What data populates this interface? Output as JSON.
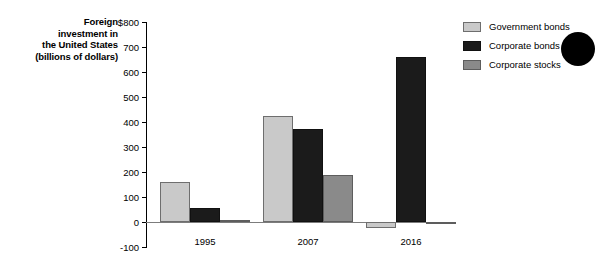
{
  "chart_data": {
    "type": "bar",
    "title": "",
    "ylabel": "Foreign investment in the United States (billions of dollars)",
    "xlabel": "",
    "categories": [
      "1995",
      "2007",
      "2016"
    ],
    "series": [
      {
        "name": "Government bonds",
        "color": "#c9c9c9",
        "values": [
          160,
          425,
          -25
        ]
      },
      {
        "name": "Corporate bonds",
        "color": "#1b1b1b",
        "values": [
          57,
          372,
          662
        ]
      },
      {
        "name": "Corporate stocks",
        "color": "#8a8a8a",
        "values": [
          10,
          190,
          -6
        ]
      }
    ],
    "ylim": [
      -100,
      800
    ],
    "ytick_values": [
      800,
      700,
      600,
      500,
      400,
      300,
      200,
      100,
      0,
      -100
    ],
    "ytick_labels": [
      "$800",
      "700",
      "600",
      "500",
      "400",
      "300",
      "200",
      "100",
      "0",
      "-100"
    ],
    "grid": false,
    "legend_position": "right"
  },
  "axis_title": {
    "line1": "Foreign",
    "line2": "investment in",
    "line3": "the United States",
    "line4": "(billions of dollars)"
  },
  "artifact": {
    "name": "black-dot"
  }
}
